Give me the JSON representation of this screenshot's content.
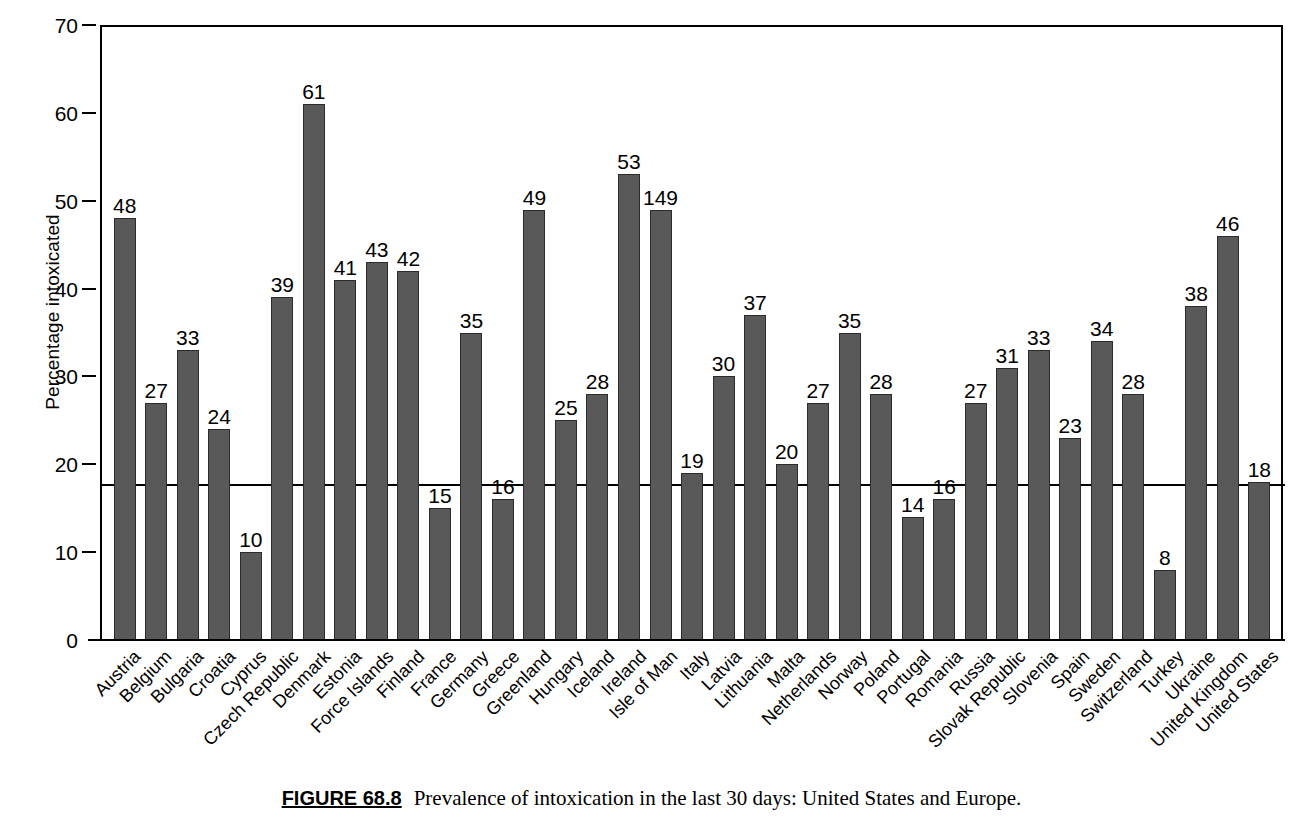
{
  "caption": {
    "figure_number": "FIGURE 68.8",
    "text": "Prevalence of intoxication in the last 30 days: United States and Europe."
  },
  "chart_data": {
    "type": "bar",
    "title": "",
    "xlabel": "",
    "ylabel": "Percentage intoxicated",
    "ylim": [
      0,
      70
    ],
    "yticks": [
      0,
      10,
      20,
      30,
      40,
      50,
      60,
      70
    ],
    "ytick_labels": [
      "0",
      "10",
      "20",
      "30",
      "40",
      "50",
      "60",
      "70"
    ],
    "grid": false,
    "legend": "none",
    "bar_color": "#595959",
    "bar_edge_color": "#2b2b2b",
    "reference_line": {
      "value": 18,
      "orientation": "horizontal",
      "color": "#000000",
      "note": "United States reference level"
    },
    "categories": [
      "Austria",
      "Belgium",
      "Bulgaria",
      "Croatia",
      "Cyprus",
      "Czech Republic",
      "Denmark",
      "Estonia",
      "Force Islands",
      "Finland",
      "France",
      "Germany",
      "Greece",
      "Greenland",
      "Hungary",
      "Iceland",
      "Ireland",
      "Isle of Man",
      "Italy",
      "Latvia",
      "Lithuania",
      "Malta",
      "Netherlands",
      "Norway",
      "Poland",
      "Portugal",
      "Romania",
      "Russia",
      "Slovak Republic",
      "Slovenia",
      "Spain",
      "Sweden",
      "Switzerland",
      "Turkey",
      "Ukraine",
      "United Kingdom",
      "United States"
    ],
    "values": [
      48,
      27,
      33,
      24,
      10,
      39,
      61,
      41,
      43,
      42,
      15,
      35,
      16,
      49,
      25,
      28,
      53,
      49,
      19,
      30,
      37,
      20,
      27,
      35,
      28,
      14,
      16,
      27,
      31,
      33,
      23,
      34,
      28,
      8,
      38,
      46,
      18
    ],
    "value_labels": [
      "48",
      "27",
      "33",
      "24",
      "10",
      "39",
      "61",
      "41",
      "43",
      "42",
      "15",
      "35",
      "16",
      "49",
      "25",
      "28",
      "53",
      "149",
      "19",
      "30",
      "37",
      "20",
      "27",
      "35",
      "28",
      "14",
      "16",
      "27",
      "31",
      "33",
      "23",
      "34",
      "28",
      "8",
      "38",
      "46",
      "18"
    ]
  }
}
